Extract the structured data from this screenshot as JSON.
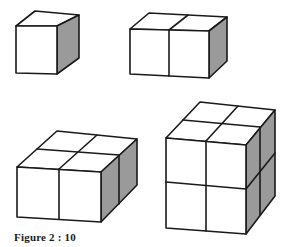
{
  "figure": {
    "caption": "Figure 2 : 10",
    "colors": {
      "line": "#1a1a1a",
      "side_shade": "#9a9a9a",
      "face": "#ffffff"
    },
    "shapes": [
      {
        "name": "single-cube",
        "columns": 1,
        "rows": 1,
        "depth": 1,
        "cube_count": 1
      },
      {
        "name": "two-cube-row",
        "columns": 2,
        "rows": 1,
        "depth": 1,
        "cube_count": 2
      },
      {
        "name": "four-cube-slab",
        "columns": 2,
        "rows": 1,
        "depth": 2,
        "cube_count": 4
      },
      {
        "name": "eight-cube-block",
        "columns": 2,
        "rows": 2,
        "depth": 2,
        "cube_count": 8
      }
    ]
  }
}
